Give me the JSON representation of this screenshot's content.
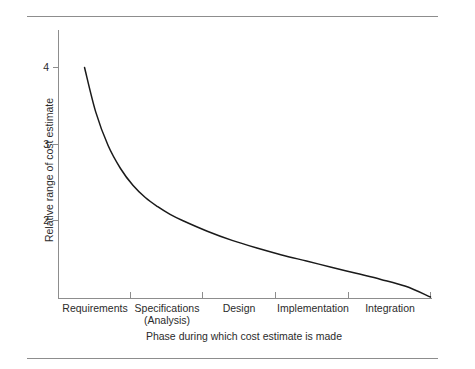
{
  "chart_data": {
    "type": "line",
    "title": "",
    "xlabel": "Phase during which cost estimate is made",
    "ylabel": "Relative range of cost estimate",
    "categories": [
      "Requirements",
      "Specifications\n(Analysis)",
      "Design",
      "Implementation",
      "Integration"
    ],
    "x_tick_labels": [
      "",
      "",
      "",
      "",
      "",
      ""
    ],
    "y_tick_labels": [
      "2",
      "3",
      "4"
    ],
    "ylim": [
      1.0,
      4.45
    ],
    "xlim": [
      0,
      6
    ],
    "grid": false,
    "legend": false,
    "series": [
      {
        "name": "Relative range of cost estimate",
        "x": [
          0.42,
          0.6,
          0.8,
          1.0,
          1.2,
          1.4,
          1.6,
          1.8,
          2.0,
          2.4,
          2.8,
          3.2,
          3.6,
          4.0,
          4.4,
          4.8,
          5.2,
          5.6,
          6.0
        ],
        "values": [
          4.0,
          3.42,
          2.98,
          2.68,
          2.46,
          2.3,
          2.18,
          2.08,
          2.0,
          1.86,
          1.74,
          1.64,
          1.55,
          1.47,
          1.39,
          1.31,
          1.23,
          1.14,
          1.0
        ]
      }
    ],
    "annotations": []
  },
  "chart": {
    "y_axis": {
      "label": "Relative range of cost estimate",
      "ticks": [
        {
          "label": "4",
          "value": 4
        },
        {
          "label": "3",
          "value": 3
        },
        {
          "label": "2",
          "value": 2
        }
      ]
    },
    "x_axis": {
      "label": "Phase during which cost estimate is made",
      "categories": [
        {
          "line1": "Requirements",
          "line2": ""
        },
        {
          "line1": "Specifications",
          "line2": "(Analysis)"
        },
        {
          "line1": "Design",
          "line2": ""
        },
        {
          "line1": "Implementation",
          "line2": ""
        },
        {
          "line1": "Integration",
          "line2": ""
        }
      ]
    },
    "colors": {
      "curve": "#1a1a1a",
      "axis": "#8d8d8d",
      "rule": "#8d8d8d",
      "text": "#2b2b2b",
      "background": "#ffffff"
    }
  }
}
